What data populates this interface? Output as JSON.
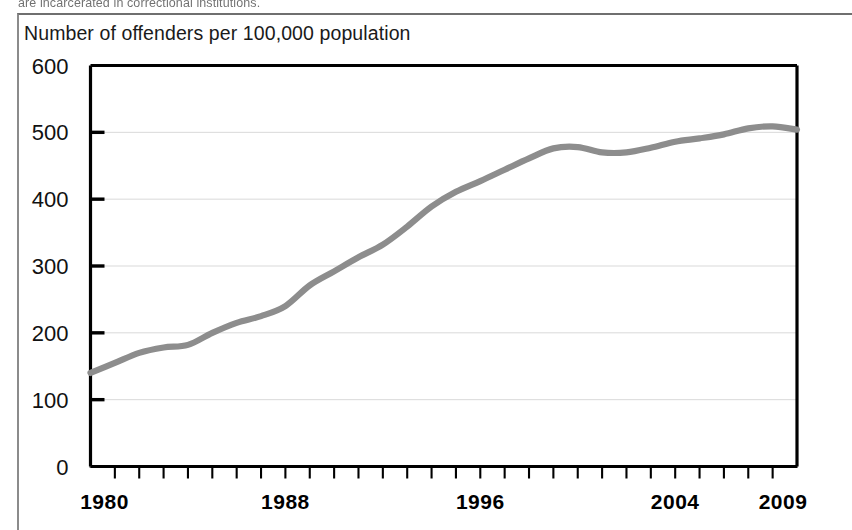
{
  "page": {
    "cut_off_text_above": "are incarcerated in correctional institutions."
  },
  "chart_data": {
    "type": "line",
    "title": "Number of offenders per 100,000 population",
    "xlabel": "",
    "ylabel": "Number of offenders per 100,000 population",
    "xlim": [
      1980,
      2009
    ],
    "ylim": [
      0,
      600
    ],
    "grid": true,
    "legend": "none",
    "line_color": "#8d8d8d",
    "y_ticks": [
      0,
      100,
      200,
      300,
      400,
      500,
      600
    ],
    "y_tick_labels": [
      "0",
      "100",
      "200",
      "300",
      "400",
      "500",
      "600"
    ],
    "x_tick_labels_shown": [
      "1980",
      "1988",
      "1996",
      "2004",
      "2009"
    ],
    "x_tick_label_years": [
      1980,
      1988,
      1996,
      2004,
      2009
    ],
    "x_minor_tick_interval_years": 1,
    "x": [
      1980,
      1981,
      1982,
      1983,
      1984,
      1985,
      1986,
      1987,
      1988,
      1989,
      1990,
      1991,
      1992,
      1993,
      1994,
      1995,
      1996,
      1997,
      1998,
      1999,
      2000,
      2001,
      2002,
      2003,
      2004,
      2005,
      2006,
      2007,
      2008,
      2009
    ],
    "values": [
      140,
      155,
      170,
      178,
      182,
      200,
      215,
      225,
      240,
      271,
      292,
      313,
      332,
      359,
      389,
      411,
      427,
      444,
      461,
      476,
      478,
      470,
      470,
      477,
      486,
      491,
      497,
      506,
      509,
      504
    ]
  }
}
